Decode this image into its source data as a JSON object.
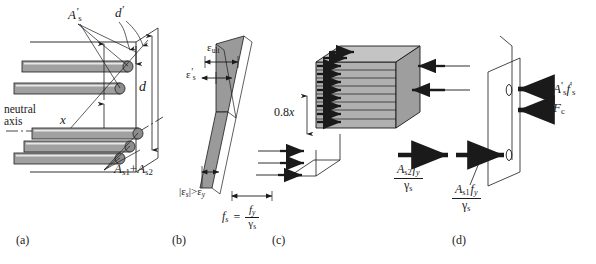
{
  "figure": {
    "width": 596,
    "height": 264,
    "background": "#ffffff",
    "ink": "#1a1a1a",
    "bar_fill": "#a0a0a0",
    "strain_fill": "#9a9a9a",
    "block_fill": "#b0b0b0"
  },
  "panels": [
    {
      "id": "a",
      "label": "(a)",
      "caption": "Cross-section with compression and tension reinforcement"
    },
    {
      "id": "b",
      "label": "(b)",
      "caption": "Strain distribution"
    },
    {
      "id": "c",
      "label": "(c)",
      "caption": "Stress block"
    },
    {
      "id": "d",
      "label": "(d)",
      "caption": "Internal force resultants"
    }
  ],
  "panel_a": {
    "compression_steel": "A's",
    "compression_steel_parts": {
      "base": "A",
      "sub": "s",
      "prime": "'"
    },
    "cover": "d'",
    "cover_parts": {
      "base": "d",
      "prime": "'"
    },
    "effective_depth": "d",
    "neutral_axis_depth": "x",
    "neutral_axis_label_line1": "neutral",
    "neutral_axis_label_line2": "axis",
    "tension_steel": "As1 + As2",
    "tension_steel_parts": {
      "first_base": "A",
      "first_sub": "s1",
      "plus": "+",
      "second_base": "A",
      "second_sub": "s2"
    }
  },
  "panel_b": {
    "ultimate_strain": "εult",
    "ultimate_strain_parts": {
      "base": "ε",
      "sub": "ult"
    },
    "compression_steel_strain": "ε's",
    "compression_steel_strain_parts": {
      "base": "ε",
      "sub": "s",
      "prime": "'"
    },
    "tension_condition": "|εs| > εy",
    "tension_condition_parts": {
      "bar_open": "|",
      "base": "ε",
      "sub": "s",
      "bar_close": "|",
      "relation": ">",
      "base2": "ε",
      "sub2": "y"
    }
  },
  "panel_c": {
    "stress_block_depth": "0.8x",
    "stress_block_depth_parts": {
      "coefficient": "0.8",
      "variable": "x"
    },
    "steel_stress_equation": "fs = fy / γs",
    "steel_stress_parts": {
      "lhs_base": "f",
      "lhs_sub": "s",
      "equals": "=",
      "num_base": "f",
      "num_sub": "y",
      "den_base": "γ",
      "den_sub": "s"
    }
  },
  "panel_d": {
    "compression_steel_force": "A's f's",
    "compression_steel_force_parts": {
      "a_base": "A",
      "a_sub": "s",
      "a_prime": "'",
      "f_base": "f",
      "f_sub": "s",
      "f_prime": "'"
    },
    "concrete_force": "Fc",
    "concrete_force_parts": {
      "base": "F",
      "sub": "c"
    },
    "tension_force_2": "As2 fy / γs",
    "tension_force_2_parts": {
      "a_base": "A",
      "a_sub": "s2",
      "f_base": "f",
      "f_sub": "y",
      "den_base": "γ",
      "den_sub": "s"
    },
    "tension_force_1": "As1 fy / γs",
    "tension_force_1_parts": {
      "a_base": "A",
      "a_sub": "s1",
      "f_base": "f",
      "f_sub": "y",
      "den_base": "γ",
      "den_sub": "s"
    }
  }
}
